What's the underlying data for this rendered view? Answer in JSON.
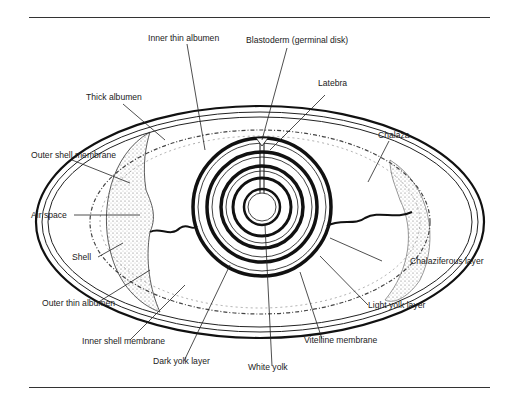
{
  "diagram": {
    "labels": {
      "inner_thin_albumen": "Inner thin albumen",
      "blastoderm": "Blastoderm (germinal disk)",
      "latebra": "Latebra",
      "thick_albumen": "Thick albumen",
      "chalaza": "Chalaza",
      "outer_shell_membrane": "Outer shell membrane",
      "air_space": "Air space",
      "shell": "Shell",
      "chalaziferous_layer": "Chalaziferous layer",
      "outer_thin_albumen": "Outer thin albumen",
      "light_yolk_layer": "Light yolk layer",
      "inner_shell_membrane": "Inner shell membrane",
      "vitelline_membrane": "Vitelline membrane",
      "dark_yolk_layer": "Dark yolk layer",
      "white_yolk": "White yolk"
    }
  }
}
